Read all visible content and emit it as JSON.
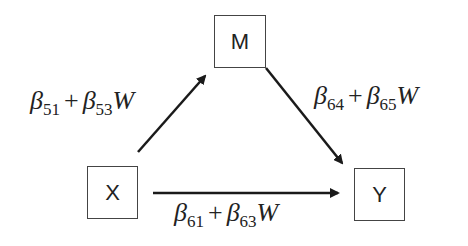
{
  "nodes": {
    "m": {
      "label": "M"
    },
    "x": {
      "label": "X"
    },
    "y": {
      "label": "Y"
    }
  },
  "edges": {
    "x_to_m": {
      "beta": "β",
      "sub1": "51",
      "plus": "+",
      "beta2": "β",
      "sub2": "53",
      "mod": "W"
    },
    "m_to_y": {
      "beta": "β",
      "sub1": "64",
      "plus": "+",
      "beta2": "β",
      "sub2": "65",
      "mod": "W"
    },
    "x_to_y": {
      "beta": "β",
      "sub1": "61",
      "plus": "+",
      "beta2": "β",
      "sub2": "63",
      "mod": "W"
    }
  },
  "colors": {
    "line": "#1a1a1a",
    "box_border": "#444444"
  }
}
